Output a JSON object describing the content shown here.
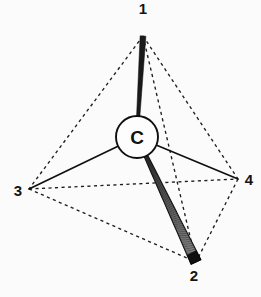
{
  "figure": {
    "background_color": "#fbfbfb",
    "ink_color": "#141414",
    "center_atom": {
      "label": "C",
      "name": "central-carbon",
      "x": 137,
      "y": 137,
      "radius": 21
    },
    "vertices": [
      {
        "id": "1",
        "label": "1",
        "x": 143,
        "y": 36,
        "label_x": 143,
        "label_y": 14,
        "bond_style": "solid-wedge"
      },
      {
        "id": "2",
        "label": "2",
        "x": 196,
        "y": 262,
        "label_x": 194,
        "label_y": 281,
        "bond_style": "hashed-wedge"
      },
      {
        "id": "3",
        "label": "3",
        "x": 29,
        "y": 189,
        "label_x": 18,
        "label_y": 196,
        "bond_style": "plain-line"
      },
      {
        "id": "4",
        "label": "4",
        "x": 238,
        "y": 179,
        "label_x": 249,
        "label_y": 185,
        "bond_style": "plain-line"
      }
    ],
    "bonds": [
      {
        "name": "bond-c-1",
        "from": "C",
        "to": "1",
        "style": "solid-wedge",
        "description": "narrow solid tapered wedge pointing up to position 1"
      },
      {
        "name": "bond-c-2",
        "from": "C",
        "to": "2",
        "style": "hashed-wedge",
        "description": "tapered wedge filled with fine parallel hatch lines, solid tip at position 2"
      },
      {
        "name": "bond-c-3",
        "from": "C",
        "to": "3",
        "style": "plain-line",
        "description": "plain solid bond line to position 3"
      },
      {
        "name": "bond-c-4",
        "from": "C",
        "to": "4",
        "style": "plain-line",
        "description": "plain solid bond line to position 4"
      }
    ],
    "cage_edges": [
      {
        "name": "cage-edge-1-3",
        "from": "1",
        "to": "3",
        "style": "dashed"
      },
      {
        "name": "cage-edge-1-4",
        "from": "1",
        "to": "4",
        "style": "dashed"
      },
      {
        "name": "cage-edge-1-2",
        "from": "1",
        "to": "2",
        "style": "dashed"
      },
      {
        "name": "cage-edge-3-4",
        "from": "3",
        "to": "4",
        "style": "dashed"
      },
      {
        "name": "cage-edge-3-2",
        "from": "3",
        "to": "2",
        "style": "dashed"
      },
      {
        "name": "cage-edge-4-2",
        "from": "4",
        "to": "2",
        "style": "dashed"
      }
    ]
  }
}
